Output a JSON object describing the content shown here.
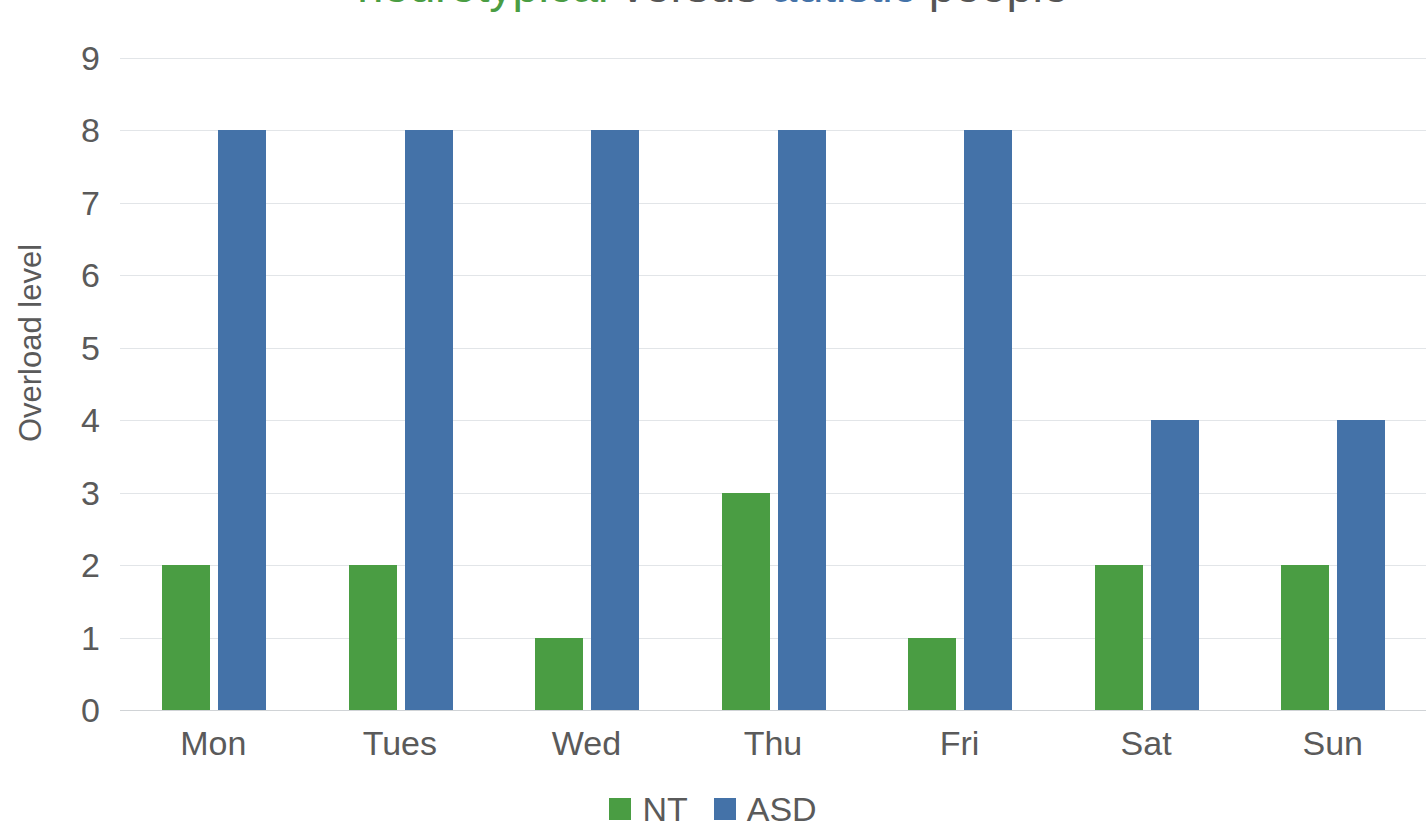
{
  "chart_data": {
    "type": "bar",
    "title": "neurotypical versus autistic people",
    "title_parts": [
      {
        "text": "neurotypical",
        "color": "#4A9D43"
      },
      {
        "text": "versus",
        "color": "#555555"
      },
      {
        "text": "autistic",
        "color": "#4472A8"
      },
      {
        "text": "people",
        "color": "#555555"
      }
    ],
    "xlabel": "",
    "ylabel": "Overload level",
    "categories": [
      "Mon",
      "Tues",
      "Wed",
      "Thu",
      "Fri",
      "Sat",
      "Sun"
    ],
    "series": [
      {
        "name": "NT",
        "color": "#4A9D43",
        "values": [
          2,
          2,
          1,
          3,
          1,
          2,
          2
        ]
      },
      {
        "name": "ASD",
        "color": "#4472A8",
        "values": [
          8,
          8,
          8,
          8,
          8,
          4,
          4
        ]
      }
    ],
    "ylim": [
      0,
      9
    ],
    "yticks": [
      0,
      1,
      2,
      3,
      4,
      5,
      6,
      7,
      8,
      9
    ],
    "ytick_labels": [
      "0",
      "1",
      "2",
      "3",
      "4",
      "5",
      "6",
      "7",
      "8",
      "9"
    ],
    "grid": true,
    "grid_axis": "y",
    "legend_position": "bottom-center",
    "plot_background": "#FFFFFF",
    "grid_color": "#E2E5E8",
    "axis_text_color": "#5A5A5A"
  },
  "legend": {
    "items": [
      {
        "label": "NT",
        "color": "#4A9D43"
      },
      {
        "label": "ASD",
        "color": "#4472A8"
      }
    ]
  },
  "axis": {
    "y_title": "Overload level"
  }
}
